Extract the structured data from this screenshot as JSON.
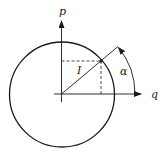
{
  "diagram": {
    "labels": {
      "p_axis": "p",
      "q_axis": "q",
      "radius": "I",
      "angle": "α"
    },
    "colors": {
      "stroke": "#1a1a1a",
      "background": "#ffffff"
    }
  }
}
